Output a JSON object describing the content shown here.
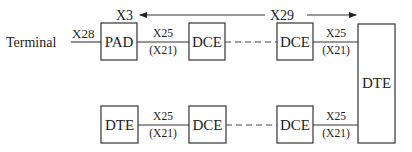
{
  "diagram": {
    "terminal_label": "Terminal",
    "x28_label": "X28",
    "x3_label": "X3",
    "x29_label": "X29",
    "top_row": {
      "pad": "PAD",
      "dce1": "DCE",
      "dce2": "DCE",
      "link1_top": "X25",
      "link1_bottom": "(X21)",
      "link2_top": "X25",
      "link2_bottom": "(X21)"
    },
    "bottom_row": {
      "dte": "DTE",
      "dce1": "DCE",
      "dce2": "DCE",
      "link1_top": "X25",
      "link1_bottom": "(X21)",
      "link2_top": "X25",
      "link2_bottom": "(X21)"
    },
    "big_dte": "DTE"
  }
}
